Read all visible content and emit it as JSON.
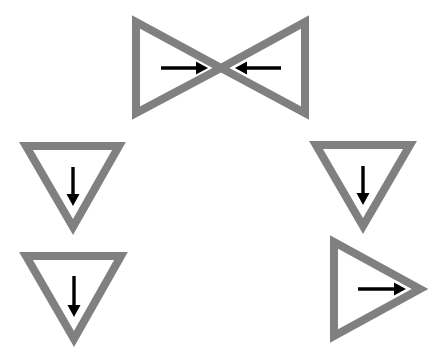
{
  "figure": {
    "background_color": "#ffffff",
    "width": 436,
    "height": 354,
    "triangle_stroke_color": "#808080",
    "triangle_stroke_width": 8,
    "arrow_color": "#000000",
    "arrow_line_width": 3,
    "shape_count": 5,
    "arrow_count": 5
  },
  "chart_data": {
    "type": "diagram",
    "xlabel": "",
    "ylabel": "",
    "shapes": [
      {
        "id": "top-left-triangle",
        "label": "Top bowtie left triangle",
        "orientation": "points-right",
        "vertices": [
          [
            136,
            22
          ],
          [
            136,
            113
          ],
          [
            221,
            68
          ]
        ],
        "arrow": {
          "direction": "right",
          "label": "right arrow",
          "from": [
            161,
            68
          ],
          "to": [
            208,
            68
          ]
        }
      },
      {
        "id": "top-right-triangle",
        "label": "Top bowtie right triangle",
        "orientation": "points-left",
        "vertices": [
          [
            305,
            22
          ],
          [
            305,
            113
          ],
          [
            221,
            68
          ]
        ],
        "arrow": {
          "direction": "left",
          "label": "left arrow",
          "from": [
            281,
            68
          ],
          "to": [
            235,
            68
          ]
        }
      },
      {
        "id": "left-middle-triangle",
        "label": "Left middle triangle",
        "orientation": "points-down",
        "vertices": [
          [
            26,
            146
          ],
          [
            119,
            146
          ],
          [
            73,
            227
          ]
        ],
        "arrow": {
          "direction": "down",
          "label": "down arrow",
          "from": [
            73,
            167
          ],
          "to": [
            73,
            206
          ]
        }
      },
      {
        "id": "left-bottom-triangle",
        "label": "Left bottom triangle",
        "orientation": "points-down",
        "vertices": [
          [
            26,
            256
          ],
          [
            121,
            256
          ],
          [
            74,
            339
          ]
        ],
        "arrow": {
          "direction": "down",
          "label": "down arrow",
          "from": [
            74,
            276
          ],
          "to": [
            74,
            317
          ]
        }
      },
      {
        "id": "right-middle-triangle",
        "label": "Right middle triangle",
        "orientation": "points-down",
        "vertices": [
          [
            316,
            145
          ],
          [
            410,
            145
          ],
          [
            363,
            226
          ]
        ],
        "arrow": {
          "direction": "down",
          "label": "down arrow",
          "from": [
            363,
            166
          ],
          "to": [
            363,
            205
          ]
        }
      },
      {
        "id": "right-bottom-triangle",
        "label": "Right bottom triangle",
        "orientation": "points-right",
        "vertices": [
          [
            334,
            242
          ],
          [
            334,
            336
          ],
          [
            420,
            289
          ]
        ],
        "arrow": {
          "direction": "right",
          "label": "right arrow",
          "from": [
            358,
            289
          ],
          "to": [
            406,
            289
          ]
        }
      }
    ]
  }
}
